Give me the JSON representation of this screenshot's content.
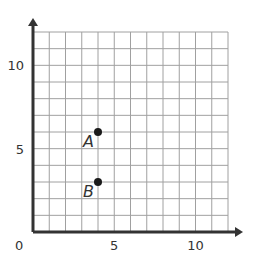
{
  "chart_data": {
    "type": "scatter",
    "title": "",
    "xlabel": "",
    "ylabel": "",
    "xlim": [
      0,
      12
    ],
    "ylim": [
      0,
      12
    ],
    "grid": true,
    "origin_label": "0",
    "x_ticks": [
      {
        "value": 5,
        "label": "5"
      },
      {
        "value": 10,
        "label": "10"
      }
    ],
    "y_ticks": [
      {
        "value": 5,
        "label": "5"
      },
      {
        "value": 10,
        "label": "10"
      }
    ],
    "points": [
      {
        "label": "A",
        "x": 4,
        "y": 6
      },
      {
        "label": "B",
        "x": 4,
        "y": 3
      }
    ]
  },
  "colors": {
    "grid": "#a0a0a0",
    "axis": "#333333",
    "point": "#1a1a1a"
  }
}
